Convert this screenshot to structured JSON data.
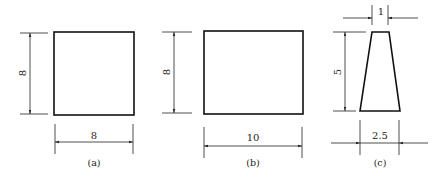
{
  "figures": [
    {
      "id": "a",
      "caption": "(a)",
      "shape": "square",
      "dimensions": {
        "height_label": "8",
        "width_label": "8"
      }
    },
    {
      "id": "b",
      "caption": "(b)",
      "shape": "rectangle",
      "dimensions": {
        "height_label": "8",
        "width_label": "10"
      }
    },
    {
      "id": "c",
      "caption": "(c)",
      "shape": "trapezoid",
      "dimensions": {
        "top_width_label": "1",
        "height_label": "5",
        "bottom_width_label": "2.5"
      }
    }
  ],
  "colors": {
    "line": "#111111",
    "background": "#ffffff"
  }
}
